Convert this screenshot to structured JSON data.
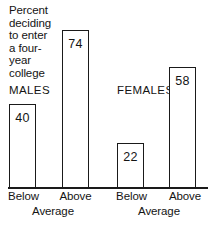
{
  "chart_data": {
    "type": "bar",
    "title_lines": [
      "Percent",
      "deciding",
      "to enter",
      "a four-",
      "year",
      "college"
    ],
    "xlabel": "",
    "ylabel": "Percent",
    "ylim": [
      0,
      100
    ],
    "grid": false,
    "legend": "none",
    "groups": [
      {
        "name": "MALES",
        "categories": [
          "Below",
          "Above"
        ],
        "category_suffix": "Average",
        "values": [
          40,
          74
        ]
      },
      {
        "name": "FEMALES",
        "categories": [
          "Below",
          "Above"
        ],
        "category_suffix": "Average",
        "values": [
          22,
          58
        ]
      }
    ],
    "categories": [
      "Below Average",
      "Above Average",
      "Below Average",
      "Above Average"
    ],
    "values": [
      40,
      74,
      22,
      58
    ],
    "value_labels": [
      "40",
      "74",
      "22",
      "58"
    ],
    "colors": {
      "bar_fill": "#ffffff",
      "bar_stroke": "#1a1a1a",
      "background": "#ffffff",
      "text": "#141414"
    }
  },
  "labels": {
    "males": "MALES",
    "females": "FEMALES",
    "below": "Below",
    "above": "Above",
    "average": "Average"
  }
}
